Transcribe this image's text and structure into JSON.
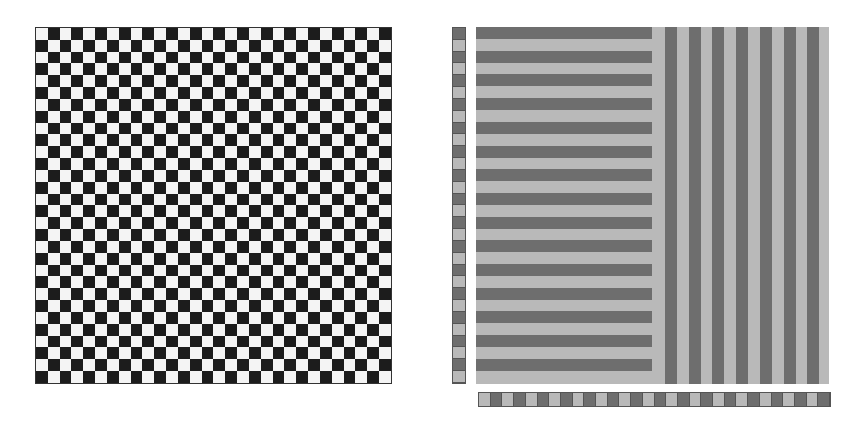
{
  "figure": {
    "left_panel": {
      "type": "checkerboard",
      "rows": 30,
      "cols": 30,
      "colors": {
        "dark": "#1c1c1c",
        "light": "#f4f4f4"
      }
    },
    "right_panel": {
      "type": "stripe-pattern",
      "background": "#b9b9b9",
      "stripe_color": "#6e6e6e",
      "horizontal_stripes": 15,
      "horizontal_region_width": 176,
      "vertical_stripes": 7,
      "vertical_start_x": 189,
      "period": 23.7,
      "stripe_thickness": 12
    },
    "side_strip": {
      "cells": 30,
      "colors": {
        "dark": "#6e6e6e",
        "light": "#b9b9b9"
      },
      "first": "dark"
    },
    "bottom_strip": {
      "cells": 30,
      "colors": {
        "dark": "#6e6e6e",
        "light": "#b9b9b9"
      },
      "first": "light"
    }
  }
}
